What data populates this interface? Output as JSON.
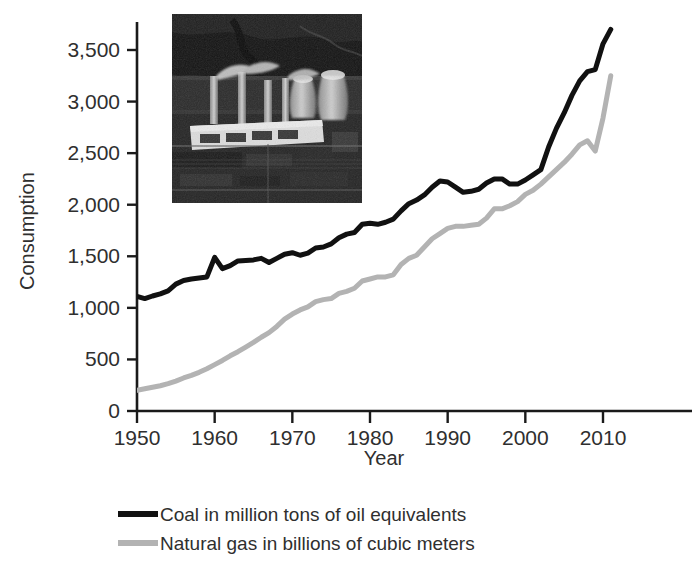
{
  "chart_data": {
    "type": "line",
    "title": "",
    "xlabel": "Year",
    "ylabel": "Consumption",
    "xlim": [
      1950,
      2011
    ],
    "ylim": [
      0,
      3750
    ],
    "xticks": [
      1950,
      1960,
      1970,
      1980,
      1990,
      2000,
      2010
    ],
    "xticklabels": [
      "1950",
      "1960",
      "1970",
      "1980",
      "1990",
      "2000",
      "2010"
    ],
    "yticks": [
      0,
      500,
      1000,
      1500,
      2000,
      2500,
      3000,
      3500
    ],
    "yticklabels": [
      "0",
      "500",
      "1,000",
      "1,500",
      "2,000",
      "2,500",
      "3,000",
      "3,500"
    ],
    "grid": false,
    "legend_position": "bottom",
    "x": [
      1950,
      1951,
      1952,
      1953,
      1954,
      1955,
      1956,
      1957,
      1958,
      1959,
      1960,
      1961,
      1962,
      1963,
      1964,
      1965,
      1966,
      1967,
      1968,
      1969,
      1970,
      1971,
      1972,
      1973,
      1974,
      1975,
      1976,
      1977,
      1978,
      1979,
      1980,
      1981,
      1982,
      1983,
      1984,
      1985,
      1986,
      1987,
      1988,
      1989,
      1990,
      1991,
      1992,
      1993,
      1994,
      1995,
      1996,
      1997,
      1998,
      1999,
      2000,
      2001,
      2002,
      2003,
      2004,
      2005,
      2006,
      2007,
      2008,
      2009,
      2010,
      2011
    ],
    "series": [
      {
        "name": "Coal in million tons of oil equivalents",
        "color": "#111111",
        "units": "million tons of oil equivalents",
        "values": [
          1110,
          1090,
          1115,
          1135,
          1165,
          1230,
          1265,
          1280,
          1290,
          1300,
          1490,
          1380,
          1410,
          1455,
          1460,
          1465,
          1480,
          1440,
          1480,
          1520,
          1535,
          1510,
          1530,
          1580,
          1590,
          1620,
          1680,
          1715,
          1730,
          1810,
          1820,
          1810,
          1830,
          1860,
          1940,
          2010,
          2045,
          2095,
          2170,
          2230,
          2220,
          2170,
          2120,
          2130,
          2150,
          2210,
          2250,
          2250,
          2200,
          2200,
          2240,
          2290,
          2340,
          2560,
          2740,
          2890,
          3060,
          3200,
          3290,
          3310,
          3560,
          3700
        ]
      },
      {
        "name": "Natural gas in billions of cubic meters",
        "color": "#b3b3b3",
        "units": "billions of cubic meters",
        "values": [
          200,
          215,
          230,
          245,
          265,
          290,
          320,
          345,
          375,
          410,
          450,
          490,
          535,
          575,
          620,
          665,
          715,
          760,
          820,
          890,
          940,
          980,
          1010,
          1060,
          1080,
          1090,
          1140,
          1160,
          1190,
          1260,
          1280,
          1300,
          1300,
          1320,
          1420,
          1480,
          1510,
          1590,
          1670,
          1720,
          1770,
          1790,
          1790,
          1800,
          1810,
          1870,
          1960,
          1960,
          1990,
          2030,
          2100,
          2140,
          2200,
          2270,
          2340,
          2410,
          2490,
          2580,
          2620,
          2520,
          2840,
          3250
        ]
      }
    ],
    "inset_image": {
      "name": "coal-power-plant-aerial-photo",
      "description": "Aerial black and white photograph of a coal power plant with smokestacks and cooling towers"
    }
  }
}
